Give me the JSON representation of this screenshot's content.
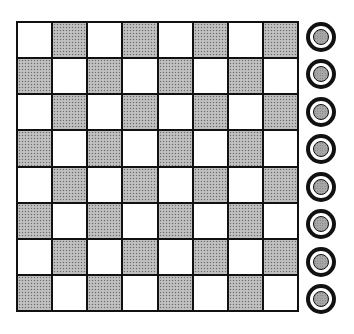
{
  "board": {
    "rows": 8,
    "cols": 8,
    "first_cell_color": "light",
    "colors": {
      "light": "#ffffff",
      "dark": "#b8b8b8",
      "grid_line": "#111111"
    }
  },
  "side_pieces": {
    "count": 8,
    "style": "ringed-disc",
    "colors": {
      "ring": "#111111",
      "center": "#a8a8a8"
    }
  }
}
